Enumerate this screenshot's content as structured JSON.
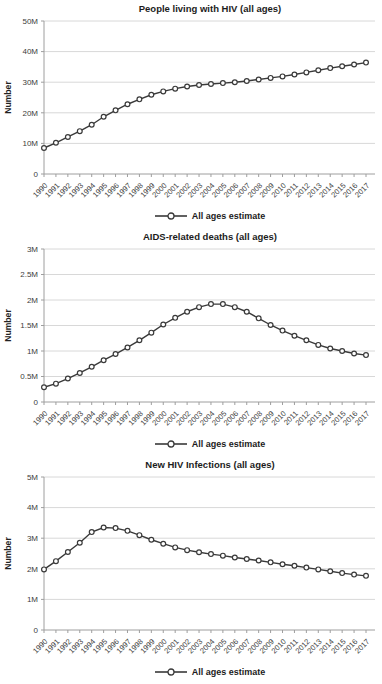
{
  "colors": {
    "line": "#3a3a3a",
    "marker_fill": "#ffffff",
    "grid": "#d8d8d8",
    "axis": "#9e9e9e",
    "tick_text": "#3d3d3d",
    "title_text": "#1c1c1c",
    "background": "#ffffff"
  },
  "chart_data": [
    {
      "type": "line",
      "title": "People living with HIV (all ages)",
      "ylabel": "Number",
      "legend_position": "bottom",
      "grid": "horizontal",
      "marker": "open-circle",
      "x": [
        "1990",
        "1991",
        "1992",
        "1993",
        "1994",
        "1995",
        "1996",
        "1997",
        "1998",
        "1999",
        "2000",
        "2001",
        "2002",
        "2003",
        "2004",
        "2005",
        "2006",
        "2007",
        "2008",
        "2009",
        "2010",
        "2011",
        "2012",
        "2013",
        "2014",
        "2015",
        "2016",
        "2017"
      ],
      "ylim": [
        0,
        50
      ],
      "unit": "millions",
      "yticks": [
        {
          "value": 0,
          "label": "0"
        },
        {
          "value": 10,
          "label": "10M"
        },
        {
          "value": 20,
          "label": "20M"
        },
        {
          "value": 30,
          "label": "30M"
        },
        {
          "value": 40,
          "label": "40M"
        },
        {
          "value": 50,
          "label": "50M"
        }
      ],
      "series": [
        {
          "name": "All ages estimate",
          "values": [
            8.5,
            10.2,
            12.1,
            14.0,
            16.1,
            18.7,
            20.8,
            22.8,
            24.4,
            25.9,
            27.0,
            27.9,
            28.6,
            29.1,
            29.4,
            29.7,
            30.0,
            30.4,
            30.9,
            31.4,
            31.9,
            32.5,
            33.2,
            33.9,
            34.6,
            35.2,
            35.8,
            36.4
          ]
        }
      ]
    },
    {
      "type": "line",
      "title": "AIDS-related deaths (all ages)",
      "ylabel": "Number",
      "legend_position": "bottom",
      "grid": "horizontal",
      "marker": "open-circle",
      "x": [
        "1990",
        "1991",
        "1992",
        "1993",
        "1994",
        "1995",
        "1996",
        "1997",
        "1998",
        "1999",
        "2000",
        "2001",
        "2002",
        "2003",
        "2004",
        "2005",
        "2006",
        "2007",
        "2008",
        "2009",
        "2010",
        "2011",
        "2012",
        "2013",
        "2014",
        "2015",
        "2016",
        "2017"
      ],
      "ylim": [
        0,
        3
      ],
      "unit": "millions",
      "yticks": [
        {
          "value": 0,
          "label": "0"
        },
        {
          "value": 0.5,
          "label": "0.5M"
        },
        {
          "value": 1,
          "label": "1M"
        },
        {
          "value": 1.5,
          "label": "1.5M"
        },
        {
          "value": 2,
          "label": "2M"
        },
        {
          "value": 2.5,
          "label": "2.5M"
        },
        {
          "value": 3,
          "label": "3M"
        }
      ],
      "series": [
        {
          "name": "All ages estimate",
          "values": [
            0.29,
            0.36,
            0.46,
            0.57,
            0.69,
            0.82,
            0.94,
            1.07,
            1.21,
            1.36,
            1.52,
            1.65,
            1.77,
            1.86,
            1.92,
            1.92,
            1.86,
            1.77,
            1.64,
            1.51,
            1.4,
            1.3,
            1.21,
            1.12,
            1.05,
            1.0,
            0.95,
            0.92
          ]
        }
      ]
    },
    {
      "type": "line",
      "title": "New HIV Infections (all ages)",
      "ylabel": "Number",
      "legend_position": "bottom",
      "grid": "horizontal",
      "marker": "open-circle",
      "x": [
        "1990",
        "1991",
        "1992",
        "1993",
        "1994",
        "1995",
        "1996",
        "1997",
        "1998",
        "1999",
        "2000",
        "2001",
        "2002",
        "2003",
        "2004",
        "2005",
        "2006",
        "2007",
        "2008",
        "2009",
        "2010",
        "2011",
        "2012",
        "2013",
        "2014",
        "2015",
        "2016",
        "2017"
      ],
      "ylim": [
        0,
        5
      ],
      "unit": "millions",
      "yticks": [
        {
          "value": 0,
          "label": "0"
        },
        {
          "value": 1,
          "label": "1M"
        },
        {
          "value": 2,
          "label": "2M"
        },
        {
          "value": 3,
          "label": "3M"
        },
        {
          "value": 4,
          "label": "4M"
        },
        {
          "value": 5,
          "label": "5M"
        }
      ],
      "series": [
        {
          "name": "All ages estimate",
          "values": [
            1.98,
            2.25,
            2.55,
            2.85,
            3.2,
            3.35,
            3.33,
            3.24,
            3.1,
            2.95,
            2.82,
            2.7,
            2.61,
            2.54,
            2.48,
            2.43,
            2.37,
            2.32,
            2.27,
            2.21,
            2.15,
            2.1,
            2.04,
            1.98,
            1.92,
            1.86,
            1.81,
            1.77
          ]
        }
      ]
    }
  ]
}
